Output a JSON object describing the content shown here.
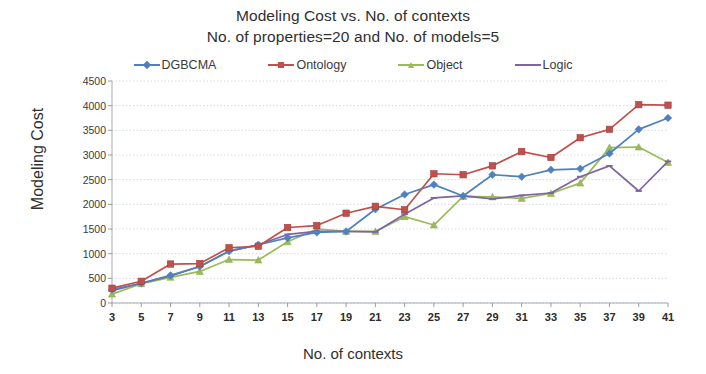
{
  "title": {
    "line1": "Modeling Cost vs. No. of contexts",
    "line2": "No. of properties=20 and No. of models=5"
  },
  "axes": {
    "ylabel": "Modeling Cost",
    "xlabel": "No. of contexts",
    "yticks": [
      "0",
      "500",
      "1000",
      "1500",
      "2000",
      "2500",
      "3000",
      "3500",
      "4000",
      "4500"
    ],
    "ymin": 0,
    "ymax": 4500,
    "ystep": 500,
    "grid": true
  },
  "legend": {
    "position": "top",
    "items": [
      {
        "label": "DGBCMA",
        "color": "#4f81bd",
        "marker": "diamond"
      },
      {
        "label": "Ontology",
        "color": "#c0504d",
        "marker": "square"
      },
      {
        "label": "Object",
        "color": "#9bbb59",
        "marker": "triangle"
      },
      {
        "label": "Logic",
        "color": "#8064a2",
        "marker": "line"
      }
    ]
  },
  "chart_data": {
    "type": "line",
    "xlabel": "No. of contexts",
    "ylabel": "Modeling Cost",
    "xlim": [
      3,
      41
    ],
    "ylim": [
      0,
      4500
    ],
    "grid": true,
    "legend_position": "top",
    "categories": [
      3,
      5,
      7,
      9,
      11,
      13,
      15,
      17,
      19,
      21,
      23,
      25,
      27,
      29,
      31,
      33,
      35,
      37,
      39,
      41
    ],
    "series": [
      {
        "name": "DGBCMA",
        "color": "#4f81bd",
        "marker": "diamond",
        "values": [
          270,
          400,
          560,
          740,
          1050,
          1180,
          1320,
          1430,
          1450,
          1900,
          2200,
          2400,
          2170,
          2600,
          2560,
          2700,
          2720,
          3030,
          3520,
          3750
        ]
      },
      {
        "name": "Ontology",
        "color": "#c0504d",
        "marker": "square",
        "values": [
          300,
          440,
          790,
          800,
          1120,
          1150,
          1530,
          1570,
          1820,
          1960,
          1890,
          2620,
          2600,
          2780,
          3070,
          2950,
          3350,
          3520,
          4020,
          4010
        ]
      },
      {
        "name": "Object",
        "color": "#9bbb59",
        "marker": "triangle",
        "values": [
          180,
          390,
          520,
          640,
          880,
          870,
          1240,
          1500,
          1450,
          1450,
          1750,
          1580,
          2160,
          2150,
          2120,
          2220,
          2430,
          3150,
          3160,
          2850
        ]
      },
      {
        "name": "Logic",
        "color": "#8064a2",
        "marker": "line",
        "values": [
          250,
          400,
          550,
          740,
          1050,
          1180,
          1390,
          1450,
          1450,
          1440,
          1800,
          2130,
          2170,
          2110,
          2180,
          2230,
          2560,
          2780,
          2270,
          2870
        ]
      }
    ]
  }
}
